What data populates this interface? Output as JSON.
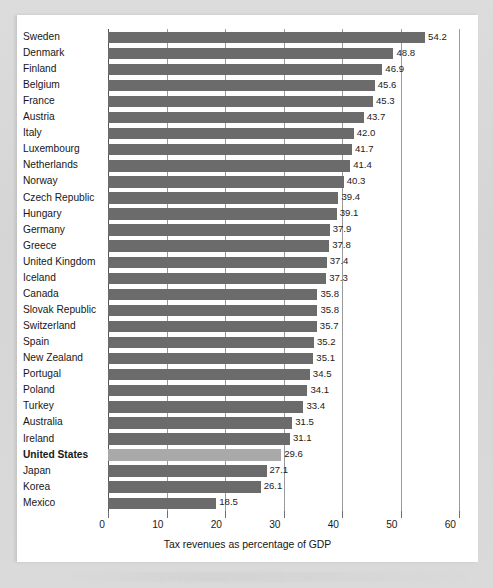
{
  "chart_data": {
    "type": "bar",
    "orientation": "horizontal",
    "title": "",
    "xlabel": "Tax revenues as percentage of GDP",
    "ylabel": "",
    "xlim": [
      0,
      60
    ],
    "xticks": [
      0,
      10,
      20,
      30,
      40,
      50,
      60
    ],
    "xtick_labels": [
      "0",
      "10",
      "20",
      "30",
      "40",
      "50",
      "60"
    ],
    "grid": "vertical-gridlines-only",
    "legend": "none",
    "bar_color": "#6b6b6b",
    "highlight_color": "#a9a9a9",
    "highlight_category": "United States",
    "categories": [
      "Sweden",
      "Denmark",
      "Finland",
      "Belgium",
      "France",
      "Austria",
      "Italy",
      "Luxembourg",
      "Netherlands",
      "Norway",
      "Czech Republic",
      "Hungary",
      "Germany",
      "Greece",
      "United Kingdom",
      "Iceland",
      "Canada",
      "Slovak Republic",
      "Switzerland",
      "Spain",
      "New Zealand",
      "Portugal",
      "Poland",
      "Turkey",
      "Australia",
      "Ireland",
      "United States",
      "Japan",
      "Korea",
      "Mexico"
    ],
    "values": [
      54.2,
      48.8,
      46.9,
      45.6,
      45.3,
      43.7,
      42.0,
      41.7,
      41.4,
      40.3,
      39.4,
      39.1,
      37.9,
      37.8,
      37.4,
      37.3,
      35.8,
      35.8,
      35.7,
      35.2,
      35.1,
      34.5,
      34.1,
      33.4,
      31.5,
      31.1,
      29.6,
      27.1,
      26.1,
      18.5
    ],
    "value_labels": [
      "54.2",
      "48.8",
      "46.9",
      "45.6",
      "45.3",
      "43.7",
      "42.0",
      "41.7",
      "41.4",
      "40.3",
      "39.4",
      "39.1",
      "37.9",
      "37.8",
      "37.4",
      "37.3",
      "35.8",
      "35.8",
      "35.7",
      "35.2",
      "35.1",
      "34.5",
      "34.1",
      "33.4",
      "31.5",
      "31.1",
      "29.6",
      "27.1",
      "26.1",
      "18.5"
    ]
  }
}
